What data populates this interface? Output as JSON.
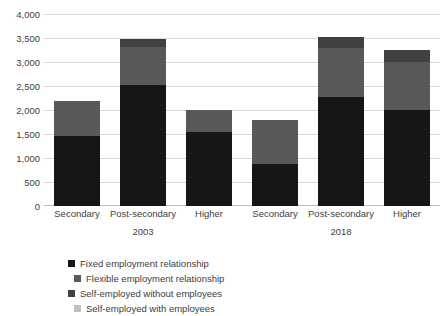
{
  "chart_data": {
    "type": "bar",
    "stacked": true,
    "title": "",
    "subtitle": "",
    "xlabel": "",
    "ylabel": "",
    "ylim": [
      0,
      4000
    ],
    "ytick_step": 500,
    "grid": true,
    "legend_position": "bottom",
    "categories": [
      "Secondary",
      "Post-secondary",
      "Higher",
      "Secondary",
      "Post-secondary",
      "Higher"
    ],
    "groups": [
      {
        "label": "2003",
        "categories": [
          "Secondary",
          "Post-secondary",
          "Higher"
        ]
      },
      {
        "label": "2018",
        "categories": [
          "Secondary",
          "Post-secondary",
          "Higher"
        ]
      }
    ],
    "ytick_labels": [
      "4,000",
      "3,500",
      "3,000",
      "2,500",
      "2,000",
      "1,500",
      "1,000",
      "500",
      "0"
    ],
    "ytick_values": [
      4000,
      3500,
      3000,
      2500,
      2000,
      1500,
      1000,
      500,
      0
    ],
    "series": [
      {
        "name": "Fixed employment relationship",
        "color": "#161616",
        "values": [
          1460,
          2520,
          1540,
          880,
          2270,
          2000
        ]
      },
      {
        "name": "Flexible employment relationship",
        "color": "#595959",
        "values": [
          720,
          800,
          460,
          910,
          1030,
          1000
        ]
      },
      {
        "name": "Self-employed without employees",
        "color": "#404040",
        "values": [
          0,
          150,
          0,
          0,
          230,
          250
        ]
      },
      {
        "name": "Self-employed with employees",
        "color": "#bfbfbf",
        "values": [
          0,
          0,
          0,
          0,
          0,
          0
        ]
      }
    ],
    "totals": [
      2180,
      3470,
      2000,
      1790,
      3530,
      3250
    ]
  },
  "legend": {
    "items": [
      {
        "label": "Fixed employment relationship",
        "color": "#161616"
      },
      {
        "label": "Flexible employment relationship",
        "color": "#595959"
      },
      {
        "label": "Self-employed without employees",
        "color": "#404040"
      },
      {
        "label": "Self-employed with employees",
        "color": "#bfbfbf"
      }
    ]
  }
}
